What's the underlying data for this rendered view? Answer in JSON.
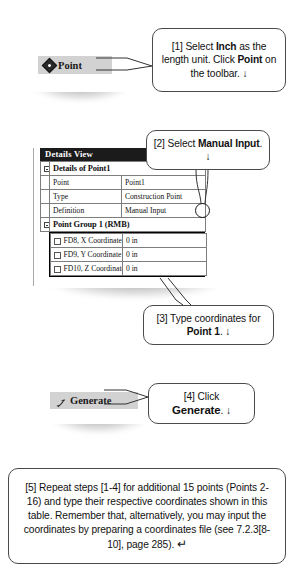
{
  "toolbar_point": {
    "label": "Point",
    "icon": "point-diamond-icon"
  },
  "toolbar_generate": {
    "label": "Generate",
    "icon": "generate-icon"
  },
  "details_view": {
    "title": "Details View",
    "section_points": {
      "header": "Details of Point1",
      "rows": [
        {
          "label": "Point",
          "value": "Point1"
        },
        {
          "label": "Type",
          "value": "Construction Point"
        },
        {
          "label": "Definition",
          "value": "Manual Input"
        }
      ]
    },
    "section_group": {
      "header": "Point Group 1  (RMB)",
      "rows": [
        {
          "label": "FD8, X Coordinate",
          "value": "0 in"
        },
        {
          "label": "FD9, Y Coordinate",
          "value": "0 in"
        },
        {
          "label": "FD10, Z Coordinate",
          "value": "0 in"
        }
      ]
    }
  },
  "callouts": {
    "step1": {
      "prefix": "[1] Select ",
      "bold1": "Inch",
      "mid": " as the length unit.  Click ",
      "bold2": "Point",
      "suffix": " on the toolbar. ",
      "arrow": "↓"
    },
    "step2": {
      "prefix": "[2] Select ",
      "bold1": "Manual Input",
      "suffix": ". ",
      "arrow": "↓"
    },
    "step3": {
      "prefix": "[3] Type coordinates for ",
      "bold1": "Point 1",
      "suffix": ". ",
      "arrow": "↓"
    },
    "step4": {
      "prefix": "[4] Click ",
      "bold1": "Generate",
      "suffix": ". ",
      "arrow": "↓"
    },
    "step5": {
      "text": "[5] Repeat steps [1-4] for additional 15 points (Points 2-16) and type their respective coordinates shown in this table. Remember that, alternatively, you may input the coordinates by preparing a coordinates file (see 7.2.3[8-10], page 285). ",
      "arrow": "↵"
    }
  }
}
